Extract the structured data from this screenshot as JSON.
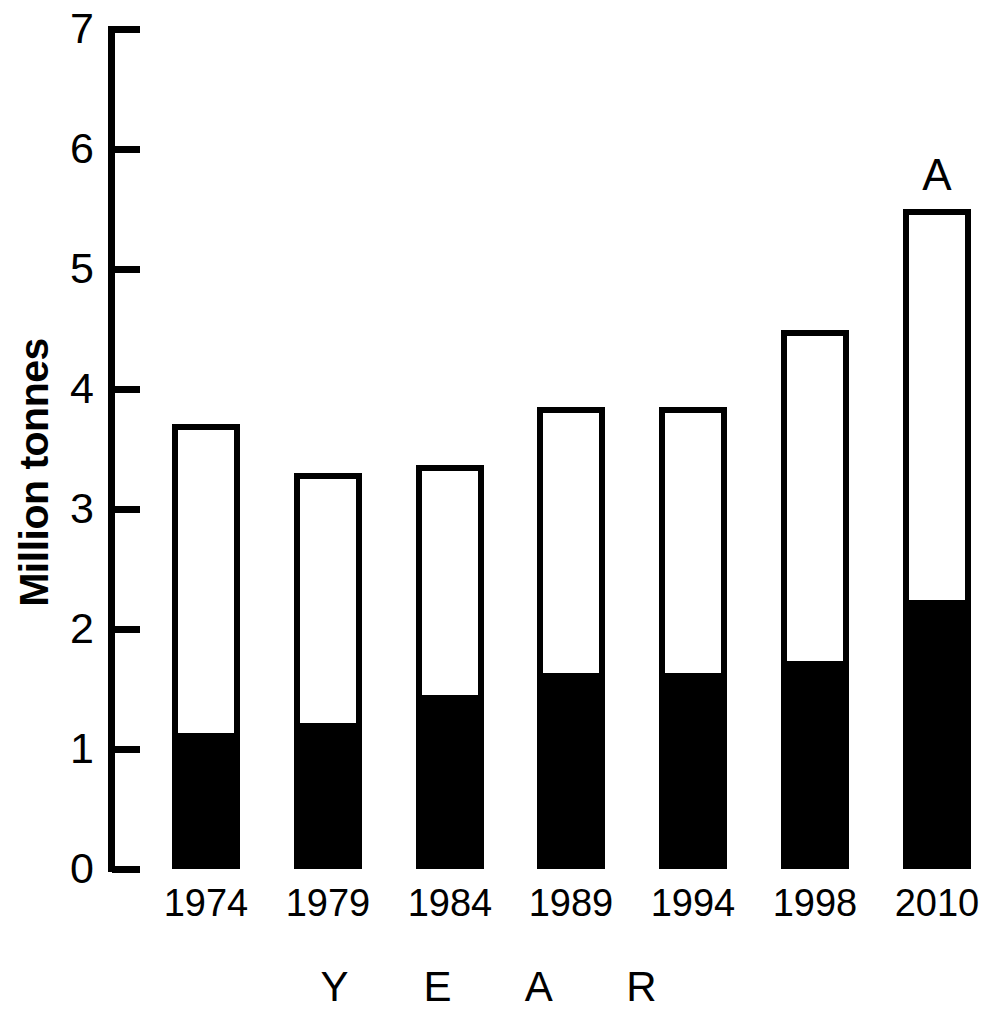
{
  "chart_data": {
    "type": "bar",
    "stacked": true,
    "title": "",
    "xlabel": "Y E A R",
    "ylabel": "Million tonnes",
    "categories": [
      "1974",
      "1979",
      "1984",
      "1989",
      "1994",
      "1998",
      "2010"
    ],
    "ylim": [
      0,
      7
    ],
    "yticks": [
      0,
      1,
      2,
      3,
      4,
      5,
      6,
      7
    ],
    "ytick_labels": [
      "0",
      "1",
      "2",
      "3",
      "4",
      "5",
      "6",
      "7"
    ],
    "grid": false,
    "legend": null,
    "series": [
      {
        "name": "filled (black) segment",
        "color": "#000000",
        "values": [
          1.13,
          1.22,
          1.45,
          1.63,
          1.63,
          1.73,
          2.24
        ]
      },
      {
        "name": "open (white) segment",
        "color": "#ffffff",
        "values": [
          2.58,
          2.08,
          1.92,
          2.22,
          2.22,
          2.76,
          3.26
        ]
      }
    ],
    "totals": [
      3.71,
      3.3,
      3.37,
      3.85,
      3.85,
      4.49,
      5.5
    ],
    "annotations": [
      {
        "category": "2010",
        "text": "A"
      }
    ]
  },
  "axis": {
    "y_title": "Million tonnes",
    "x_title": "Y E A R"
  },
  "colors": {
    "ink": "#000000",
    "paper": "#ffffff"
  }
}
